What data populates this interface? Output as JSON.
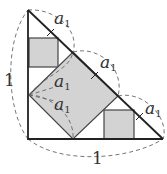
{
  "diagram": {
    "title": "",
    "colors": {
      "stroke": "#222222",
      "fill": "#d3d3d3",
      "dashed": "#666666",
      "text": "#333333"
    },
    "labels": {
      "a1_top": {
        "base": "a",
        "sub": "1"
      },
      "a1_mid_right": {
        "base": "a",
        "sub": "1"
      },
      "a1_inner_upper": {
        "base": "a",
        "sub": "1"
      },
      "a1_inner_lower": {
        "base": "a",
        "sub": "1"
      },
      "a1_lower_right": {
        "base": "a",
        "sub": "1"
      },
      "side_left": "1",
      "side_bottom": "1"
    }
  }
}
